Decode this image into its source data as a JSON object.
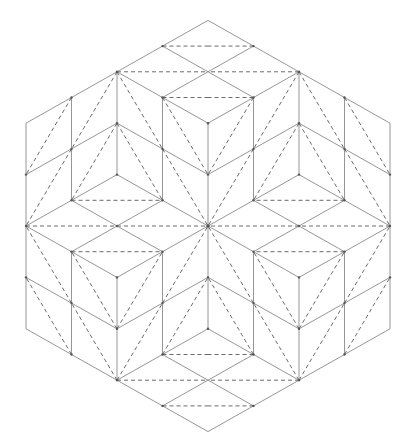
{
  "diagram": {
    "shape": "hexagon",
    "origin_px": [
      208,
      226
    ],
    "unit_px": [
      45.5,
      25.7
    ],
    "colors": {
      "background": "#ffffff",
      "solid_line": "#8a8a8a",
      "dashed_line": "#5a5a5a",
      "vertex_dot": "#555555"
    },
    "symmetry": "mirror-x-and-y",
    "quadrant_solid_segments": [
      [
        [
          0,
          -8
        ],
        [
          -4,
          -4
        ]
      ],
      [
        [
          -4,
          -4
        ],
        [
          -4,
          0
        ]
      ],
      [
        [
          -1,
          -7
        ],
        [
          0,
          -6
        ]
      ],
      [
        [
          -2,
          -6
        ],
        [
          -1,
          -5
        ]
      ],
      [
        [
          -1,
          -5
        ],
        [
          0,
          -6
        ]
      ],
      [
        [
          -1,
          -5
        ],
        [
          0,
          -4
        ]
      ],
      [
        [
          0,
          -4
        ],
        [
          0,
          0
        ]
      ],
      [
        [
          -1,
          -5
        ],
        [
          -1,
          -1
        ]
      ],
      [
        [
          -1,
          -3
        ],
        [
          0,
          -2
        ]
      ],
      [
        [
          -1,
          -1
        ],
        [
          0,
          0
        ]
      ],
      [
        [
          -2,
          -6
        ],
        [
          -2,
          -2
        ]
      ],
      [
        [
          -3,
          -5
        ],
        [
          -3,
          -1
        ]
      ],
      [
        [
          -3,
          -3
        ],
        [
          -2,
          -4
        ]
      ],
      [
        [
          -2,
          -4
        ],
        [
          -1,
          -3
        ]
      ],
      [
        [
          -3,
          -3
        ],
        [
          -4,
          -2
        ]
      ],
      [
        [
          -2,
          -2
        ],
        [
          -3,
          -1
        ]
      ],
      [
        [
          -2,
          -2
        ],
        [
          -1,
          -1
        ]
      ],
      [
        [
          -3,
          -1
        ],
        [
          -4,
          0
        ]
      ],
      [
        [
          -3,
          -1
        ],
        [
          -2,
          0
        ]
      ],
      [
        [
          -1,
          -1
        ],
        [
          -2,
          0
        ]
      ]
    ],
    "quadrant_dashed_segments": [
      [
        [
          -1,
          -7
        ],
        [
          0,
          -7
        ]
      ],
      [
        [
          -2,
          -6
        ],
        [
          0,
          -6
        ]
      ],
      [
        [
          -1,
          -5
        ],
        [
          0,
          -5
        ]
      ],
      [
        [
          -1,
          -5
        ],
        [
          0,
          -2
        ]
      ],
      [
        [
          -1,
          -3
        ],
        [
          0,
          0
        ]
      ],
      [
        [
          -2,
          -6
        ],
        [
          -3,
          -3
        ]
      ],
      [
        [
          -2,
          -6
        ],
        [
          -1,
          -3
        ]
      ],
      [
        [
          -2,
          -4
        ],
        [
          -3,
          -1
        ]
      ],
      [
        [
          -2,
          -4
        ],
        [
          -1,
          -1
        ]
      ],
      [
        [
          -3,
          -5
        ],
        [
          -4,
          -2
        ]
      ],
      [
        [
          -3,
          -3
        ],
        [
          -4,
          0
        ]
      ],
      [
        [
          -3,
          -1
        ],
        [
          -1,
          -1
        ]
      ],
      [
        [
          -4,
          0
        ],
        [
          0,
          0
        ]
      ]
    ],
    "vertex_dots": [
      [
        0,
        0
      ],
      [
        -2,
        -6
      ],
      [
        2,
        -6
      ],
      [
        -1,
        -5
      ],
      [
        1,
        -5
      ],
      [
        -2,
        -4
      ],
      [
        2,
        -4
      ],
      [
        -1,
        -3
      ],
      [
        1,
        -3
      ],
      [
        -3,
        -5
      ],
      [
        3,
        -5
      ],
      [
        -3,
        -3
      ],
      [
        3,
        -3
      ],
      [
        -3,
        -1
      ],
      [
        3,
        -1
      ],
      [
        -1,
        -1
      ],
      [
        1,
        -1
      ],
      [
        -4,
        0
      ],
      [
        4,
        0
      ],
      [
        -2,
        6
      ],
      [
        2,
        6
      ],
      [
        -1,
        5
      ],
      [
        1,
        5
      ],
      [
        -2,
        4
      ],
      [
        2,
        4
      ],
      [
        -1,
        3
      ],
      [
        1,
        3
      ],
      [
        -3,
        5
      ],
      [
        3,
        5
      ],
      [
        -3,
        3
      ],
      [
        3,
        3
      ],
      [
        -3,
        1
      ],
      [
        3,
        1
      ],
      [
        -1,
        1
      ],
      [
        1,
        1
      ],
      [
        -1,
        -7
      ],
      [
        1,
        -7
      ],
      [
        -1,
        7
      ],
      [
        1,
        7
      ],
      [
        -4,
        -2
      ],
      [
        4,
        -2
      ],
      [
        -4,
        2
      ],
      [
        4,
        2
      ],
      [
        -2,
        -2
      ],
      [
        2,
        -2
      ],
      [
        -2,
        2
      ],
      [
        2,
        2
      ],
      [
        -2,
        0
      ],
      [
        2,
        0
      ],
      [
        0,
        -2
      ],
      [
        0,
        2
      ],
      [
        0,
        -4
      ],
      [
        0,
        4
      ]
    ]
  }
}
